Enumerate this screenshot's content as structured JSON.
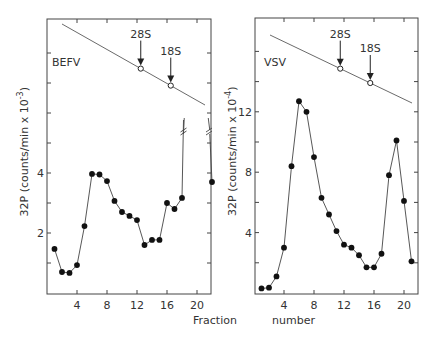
{
  "figure": {
    "xlabel_left": "Fraction",
    "xlabel_right": "number"
  },
  "chart_data": [
    {
      "type": "line",
      "panel": "left",
      "title": "BEFV",
      "xlabel": "Fraction number",
      "ylabel": "32P (counts/min x 10^-3)",
      "ylabel_prefix": "32P",
      "ylabel_main": "(counts/min x 10",
      "ylabel_exp": "-3",
      "xlim": [
        0,
        22.5
      ],
      "ylim": [
        0,
        9
      ],
      "x_ticks": [
        4,
        8,
        12,
        16,
        20
      ],
      "y_ticks_labeled": [
        2,
        4
      ],
      "y_ticks_minor": [
        1,
        2,
        3,
        4,
        5,
        6,
        7,
        8
      ],
      "x": [
        1,
        2,
        3,
        4,
        5,
        6,
        7,
        8,
        9,
        10,
        11,
        12,
        13,
        14,
        15,
        16,
        17,
        18,
        22
      ],
      "values": [
        1.47,
        0.7,
        0.67,
        0.93,
        2.23,
        3.97,
        3.95,
        3.73,
        3.07,
        2.7,
        2.57,
        2.43,
        1.6,
        1.77,
        1.77,
        3.0,
        2.8,
        3.17,
        3.7
      ],
      "annotations": [
        "off-scale peak near fractions 19-21 (axis break //)"
      ],
      "markers": [
        {
          "label": "28S",
          "fraction": 12.5
        },
        {
          "label": "18S",
          "fraction": 16.5
        }
      ]
    },
    {
      "type": "line",
      "panel": "right",
      "title": "VSV",
      "xlabel": "Fraction number",
      "ylabel": "32P (counts/min x 10^-4)",
      "ylabel_prefix": "32P",
      "ylabel_main": "(counts/min x 10",
      "ylabel_exp": "-4",
      "xlim": [
        0,
        22
      ],
      "ylim": [
        0,
        18
      ],
      "x_ticks": [
        4,
        8,
        12,
        16,
        20
      ],
      "y_ticks_labeled": [
        4,
        8,
        12
      ],
      "y_ticks_minor": [
        2,
        4,
        6,
        8,
        10,
        12,
        14,
        16
      ],
      "x": [
        1,
        2,
        3,
        4,
        5,
        6,
        7,
        8,
        9,
        10,
        11,
        12,
        13,
        14,
        15,
        16,
        17,
        18,
        19,
        20,
        21
      ],
      "values": [
        0.3,
        0.35,
        1.1,
        3.0,
        8.4,
        12.7,
        12.0,
        9.0,
        6.3,
        5.2,
        4.1,
        3.2,
        3.0,
        2.5,
        1.7,
        1.7,
        2.6,
        7.8,
        10.1,
        6.1,
        2.1
      ],
      "markers": [
        {
          "label": "28S",
          "fraction": 11.5
        },
        {
          "label": "18S",
          "fraction": 15.5
        }
      ]
    }
  ]
}
